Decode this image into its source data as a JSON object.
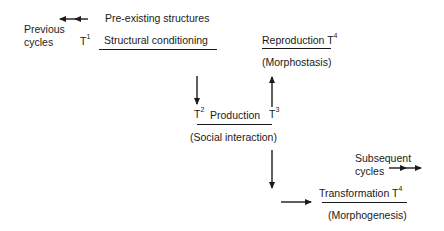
{
  "diagram": {
    "top_left": {
      "previous_cycles_line1": "Previous",
      "previous_cycles_line2": "cycles",
      "t1_label": "T",
      "t1_sup": "1",
      "pre_existing": "Pre-existing structures",
      "structural_conditioning": "Structural conditioning"
    },
    "reproduction": {
      "label": "Reproduction T",
      "sup": "4",
      "sub_label": "(Morphostasis)"
    },
    "production": {
      "t2_label": "T",
      "t2_sup": "2",
      "label": "Production",
      "t3_label": "T",
      "t3_sup": "3",
      "sub_label": "(Social interaction)"
    },
    "transformation": {
      "subsequent_line1": "Subsequent",
      "subsequent_line2": "cycles",
      "label": "Transformation T",
      "sup": "4",
      "sub_label": "(Morphogenesis)"
    }
  }
}
